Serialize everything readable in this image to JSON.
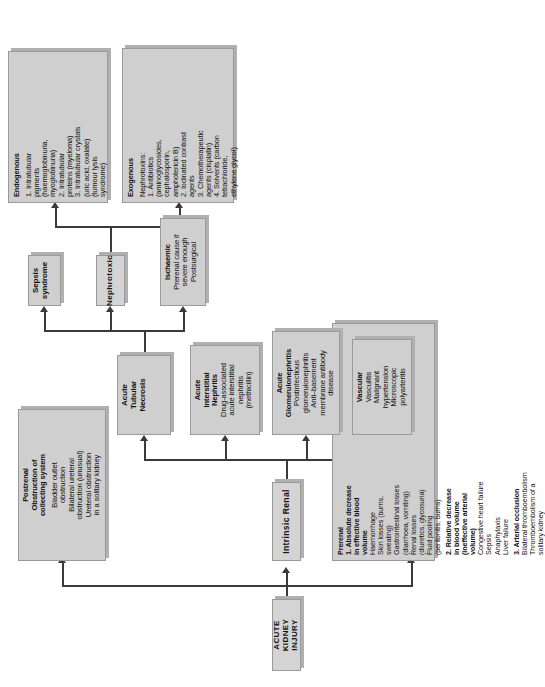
{
  "diagram": {
    "title": "ACUTE KIDNEY INJURY",
    "orientation": "rotated-90",
    "nodes": {
      "root": {
        "label": "ACUTE KIDNEY INJURY"
      },
      "prerenal": {
        "title": "Prerenal",
        "items": [
          "1. Absolute decrease in effective blood volume",
          "Haemorrhage",
          "Skin losses (burns, sweating)",
          "Gastrointestinal losses (diarrhoea, vomiting)",
          "Renal losses (diuretics, glycosuria)",
          "Fluid pooling (peritonitis, burns)",
          "2. Relative decrease in blood volume (ineffective arterial volume)",
          "Congestive heart failure",
          "Sepsis",
          "Anaphylaxis",
          "Liver failure",
          "3. Arterial occlusion",
          "Bilateral thromboembolism",
          "Thromboembolism of a solitary kidney"
        ],
        "headings": [
          "1. Absolute decrease in effective blood volume",
          "2. Relative decrease in blood volume (ineffective arterial volume)",
          "3. Arterial occlusion"
        ],
        "lines": [
          {
            "text": "Prerenal",
            "bold": true,
            "center": true
          },
          {
            "text": "1. Absolute decrease",
            "bold": true
          },
          {
            "text": "in effective blood",
            "bold": true
          },
          {
            "text": "volume",
            "bold": true
          },
          {
            "text": "Haemorrhage",
            "bold": false
          },
          {
            "text": "Skin losses (burns,",
            "bold": false
          },
          {
            "text": "sweating)",
            "bold": false
          },
          {
            "text": "Gastrointestinal losses",
            "bold": false
          },
          {
            "text": "(diarrhoea, vomiting)",
            "bold": false
          },
          {
            "text": "Renal losses",
            "bold": false
          },
          {
            "text": "(diuretics, glycosuria)",
            "bold": false
          },
          {
            "text": "Fluid pooling",
            "bold": false
          },
          {
            "text": "(peritonitis, burns)",
            "bold": false
          },
          {
            "text": "",
            "bold": false
          },
          {
            "text": "2. Relative decrease",
            "bold": true
          },
          {
            "text": "in blood volume",
            "bold": true
          },
          {
            "text": "(ineffective arterial",
            "bold": true
          },
          {
            "text": "volume)",
            "bold": true
          },
          {
            "text": "Congestive heart failure",
            "bold": false
          },
          {
            "text": "Sepsis",
            "bold": false
          },
          {
            "text": "Anaphylaxis",
            "bold": false
          },
          {
            "text": "Liver failure",
            "bold": false
          },
          {
            "text": "",
            "bold": false
          },
          {
            "text": "3. Arterial occlusion",
            "bold": true
          },
          {
            "text": "Bilateral thromboembolism",
            "bold": false
          },
          {
            "text": "Thromboembolism of a",
            "bold": false
          },
          {
            "text": "solitary kidney",
            "bold": false
          }
        ]
      },
      "intrinsic": {
        "label": "Intrinsic Renal"
      },
      "postrenal": {
        "lines": [
          {
            "text": "Postrenal",
            "bold": true
          },
          {
            "text": "Obstruction of",
            "bold": true
          },
          {
            "text": "collecting system",
            "bold": true
          },
          {
            "text": "",
            "bold": false
          },
          {
            "text": "Bladder outlet",
            "bold": false
          },
          {
            "text": "obstruction",
            "bold": false
          },
          {
            "text": "Bilateral ureteral",
            "bold": false
          },
          {
            "text": "obstruction (unusual)",
            "bold": false
          },
          {
            "text": "Ureteral obstruction",
            "bold": false
          },
          {
            "text": "in a solitary kidney",
            "bold": false
          }
        ]
      },
      "vascular": {
        "lines": [
          {
            "text": "Vascular",
            "bold": true
          },
          {
            "text": "Vasculitis",
            "bold": false
          },
          {
            "text": "Malignant",
            "bold": false
          },
          {
            "text": "hypertension",
            "bold": false
          },
          {
            "text": "Microscopic",
            "bold": false
          },
          {
            "text": "polyarteritis",
            "bold": false
          }
        ]
      },
      "glomerulonephritis": {
        "lines": [
          {
            "text": "Acute",
            "bold": true
          },
          {
            "text": "Glomerulonephritis",
            "bold": true
          },
          {
            "text": "Postinfectious",
            "bold": false
          },
          {
            "text": "glomerulonephritis",
            "bold": false
          },
          {
            "text": "Anti–basement",
            "bold": false
          },
          {
            "text": "membrane antibody",
            "bold": false
          },
          {
            "text": "disease",
            "bold": false
          }
        ]
      },
      "interstitial_nephritis": {
        "lines": [
          {
            "text": "Acute",
            "bold": true
          },
          {
            "text": "Interstitial",
            "bold": true
          },
          {
            "text": "Nephritis",
            "bold": true
          },
          {
            "text": "Drug-associated",
            "bold": false
          },
          {
            "text": "acute interstitial",
            "bold": false
          },
          {
            "text": "nephritis",
            "bold": false
          },
          {
            "text": "(methicillin)",
            "bold": false
          }
        ]
      },
      "atn": {
        "lines": [
          {
            "text": "Acute",
            "bold": true
          },
          {
            "text": "Tubular",
            "bold": true
          },
          {
            "text": "Necrosis",
            "bold": true
          }
        ]
      },
      "ischaemic": {
        "lines": [
          {
            "text": "Ischaemic",
            "bold": true
          },
          {
            "text": "Prerenal cause if",
            "bold": false
          },
          {
            "text": "severe enough",
            "bold": false
          },
          {
            "text": "Postsurgical",
            "bold": false
          }
        ]
      },
      "nephrotoxic": {
        "label": "Nephrotoxic"
      },
      "sepsis": {
        "lines": [
          {
            "text": "Sepsis",
            "bold": true
          },
          {
            "text": "syndrome",
            "bold": true
          }
        ]
      },
      "exogenous": {
        "lines": [
          {
            "text": "Exogenous",
            "bold": true
          },
          {
            "text": "",
            "bold": false
          },
          {
            "text": "Nephrotoxins:",
            "bold": false
          },
          {
            "text": "1. Antibiotics",
            "bold": false
          },
          {
            "text": "(aminoglycosides,",
            "bold": false
          },
          {
            "text": "cephalosporin,",
            "bold": false
          },
          {
            "text": "amphotericin B)",
            "bold": false
          },
          {
            "text": "2. Iodinated contrast",
            "bold": false
          },
          {
            "text": "agents",
            "bold": false
          },
          {
            "text": "3. Chemotherapeutic",
            "bold": false
          },
          {
            "text": "agents (cisplatin)",
            "bold": false
          },
          {
            "text": "4. Solvents (carbon",
            "bold": false
          },
          {
            "text": "tetrachloride,",
            "bold": false
          },
          {
            "text": "ethylene glycol)",
            "bold": false
          }
        ]
      },
      "endogenous": {
        "lines": [
          {
            "text": "Endogenous",
            "bold": true
          },
          {
            "text": "",
            "bold": false
          },
          {
            "text": "1. Intratubular",
            "bold": false
          },
          {
            "text": "pigments",
            "bold": false
          },
          {
            "text": "(haemoglobinuria,",
            "bold": false
          },
          {
            "text": "myoglobinuria)",
            "bold": false
          },
          {
            "text": "2. Intratubular",
            "bold": false
          },
          {
            "text": "proteins (myeloma)",
            "bold": false
          },
          {
            "text": "3. Intratubular crystals",
            "bold": false
          },
          {
            "text": "(uric acid, oxalate)",
            "bold": false
          },
          {
            "text": "(tumour lysis",
            "bold": false
          },
          {
            "text": "syndrome)",
            "bold": false
          }
        ]
      }
    },
    "colors": {
      "node_fill": "#cfcfcf",
      "node_border": "#9a9a9a",
      "shadow": "#b0b0b0",
      "connector": "#3a3a3a",
      "background": "#ffffff",
      "text": "#111111"
    }
  }
}
